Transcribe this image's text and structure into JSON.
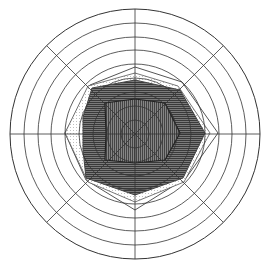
{
  "chart_data": {
    "type": "radar",
    "title": "",
    "center": [
      135,
      134
    ],
    "axes_count": 8,
    "axes_angles_deg": [
      0,
      45,
      90,
      135,
      180,
      225,
      270,
      315
    ],
    "ring_count": 9,
    "ring_radii_px": [
      14,
      28,
      42,
      56,
      70,
      84,
      97,
      111,
      125
    ],
    "grid": true,
    "legend": null,
    "colors": {
      "background": "#ffffff",
      "grid": "#333333",
      "dark_fill": "#6e6e6e",
      "hatch": "#3a3a3a",
      "inner_fill": "#7a7a7a",
      "outline_light": "#555555",
      "dotted": "#999999"
    },
    "series": [
      {
        "name": "outer-thin",
        "style": "thin-line",
        "points": [
          [
            135,
            67
          ],
          [
            182,
            82
          ],
          [
            218,
            133
          ],
          [
            186,
            178
          ],
          [
            135,
            210
          ],
          [
            86,
            180
          ],
          [
            65,
            133
          ],
          [
            90,
            85
          ]
        ]
      },
      {
        "name": "dotted",
        "style": "dotted-fill",
        "points": [
          [
            135,
            73
          ],
          [
            178,
            86
          ],
          [
            210,
            133
          ],
          [
            184,
            182
          ],
          [
            135,
            202
          ],
          [
            88,
            182
          ],
          [
            65,
            133
          ],
          [
            88,
            86
          ]
        ]
      },
      {
        "name": "dark-filled",
        "style": "dark-horizontal-hatch",
        "points": [
          [
            135,
            80
          ],
          [
            180,
            90
          ],
          [
            205,
            133
          ],
          [
            183,
            178
          ],
          [
            135,
            195
          ],
          [
            86,
            178
          ],
          [
            83,
            150
          ],
          [
            83,
            117
          ],
          [
            92,
            88
          ]
        ]
      },
      {
        "name": "inner",
        "style": "vertical-hatch",
        "points": [
          [
            135,
            99
          ],
          [
            165,
            103
          ],
          [
            180,
            133
          ],
          [
            165,
            160
          ],
          [
            135,
            163
          ],
          [
            105,
            160
          ],
          [
            106,
            133
          ],
          [
            105,
            103
          ]
        ]
      }
    ]
  }
}
